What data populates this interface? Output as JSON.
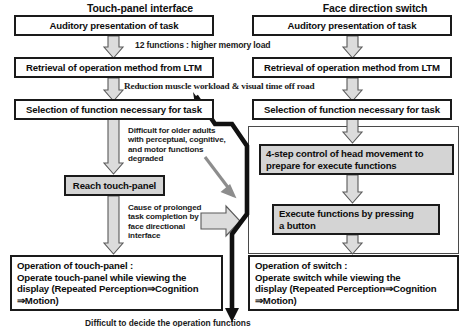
{
  "diagram": {
    "title_left": "Touch-panel interface",
    "title_right": "Face direction switch",
    "columns": {
      "left": {
        "header": "Touch-panel interface",
        "boxes": [
          {
            "id": "l1",
            "label": "Auditory presentation of task",
            "style": "white"
          },
          {
            "id": "l2",
            "label": "Retrieval of operation method from LTM",
            "style": "white"
          },
          {
            "id": "l3",
            "label": "Selection of function necessary for task",
            "style": "white"
          },
          {
            "id": "l4",
            "label": "Reach touch-panel",
            "style": "gray"
          },
          {
            "id": "l5",
            "label": "Operation of touch-panel :\nOperate touch-panel while viewing the\ndisplay (Repeated Perception⇒Cognition\n⇒Motion)",
            "style": "white"
          }
        ]
      },
      "right": {
        "header": "Face direction switch",
        "boxes": [
          {
            "id": "r1",
            "label": "Auditory presentation of task",
            "style": "white"
          },
          {
            "id": "r2",
            "label": "Retrieval of operation method from LTM",
            "style": "white"
          },
          {
            "id": "r3",
            "label": "Selection of function necessary for task",
            "style": "white"
          },
          {
            "id": "r4",
            "label": "4-step control of head movement to\nprepare for execute functions",
            "style": "gray"
          },
          {
            "id": "r5",
            "label": "Execute functions by pressing\na button",
            "style": "gray"
          },
          {
            "id": "r6",
            "label": "Operation of switch :\nOperate switch while viewing the\ndisplay (Repeated Perception⇒Cognition\n⇒Motion)",
            "style": "white"
          }
        ]
      }
    },
    "annotations": {
      "memory_load": "12 functions : higher memory load",
      "reduction": "Reduction muscle workload & visual time off road",
      "difficult": "Difficult for older adults\nwith perceptual, cognitive,\nand motor functions\ndegraded",
      "prolonged": "Cause of prolonged\ntask completion by\nface directional\ninterface",
      "bottom_cut": "Difficult to decide the operation functions"
    },
    "colors": {
      "box_border": "#1a1a1a",
      "box_fill_white": "#ffffff",
      "box_fill_gray": "#d4d4d4",
      "arrow_gray_fill": "#d8d8d8",
      "arrow_gray_stroke": "#555555",
      "arrow_black": "#111111",
      "arrow_diagonal_gray": "#8a8a8a",
      "frame_border": "#4a4a4a",
      "text": "#111111",
      "page_background": "#ffffff"
    }
  }
}
